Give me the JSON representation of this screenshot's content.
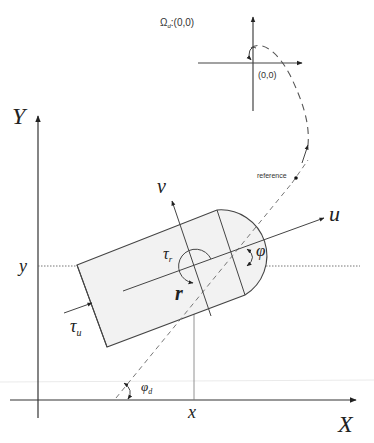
{
  "diagram": {
    "type": "vehicle kinematics diagram (planar, body-fixed frame)",
    "inertial_frame": {
      "x_axis_label": "X",
      "y_axis_label": "Y",
      "position_x_label": "x",
      "position_y_label": "y"
    },
    "body_frame": {
      "surge_axis_label": "u",
      "sway_axis_label": "v",
      "yaw_rate_label": "r",
      "heading_angle_label": "φ"
    },
    "inputs": {
      "surge_force_label": "τ",
      "surge_force_subscript": "u",
      "yaw_moment_label": "τ",
      "yaw_moment_subscript": "r"
    },
    "desired_heading_label": "φ",
    "desired_heading_subscript": "d",
    "reference_label": "reference",
    "target_frame": {
      "set_label_symbol": "Ω",
      "set_label_subscript": "d",
      "set_label_value": ":(0,0)",
      "origin_label": "(0,0)"
    }
  },
  "colors": {
    "line": "#333333",
    "body_fill": "#f2f2f2",
    "background": "#ffffff"
  }
}
